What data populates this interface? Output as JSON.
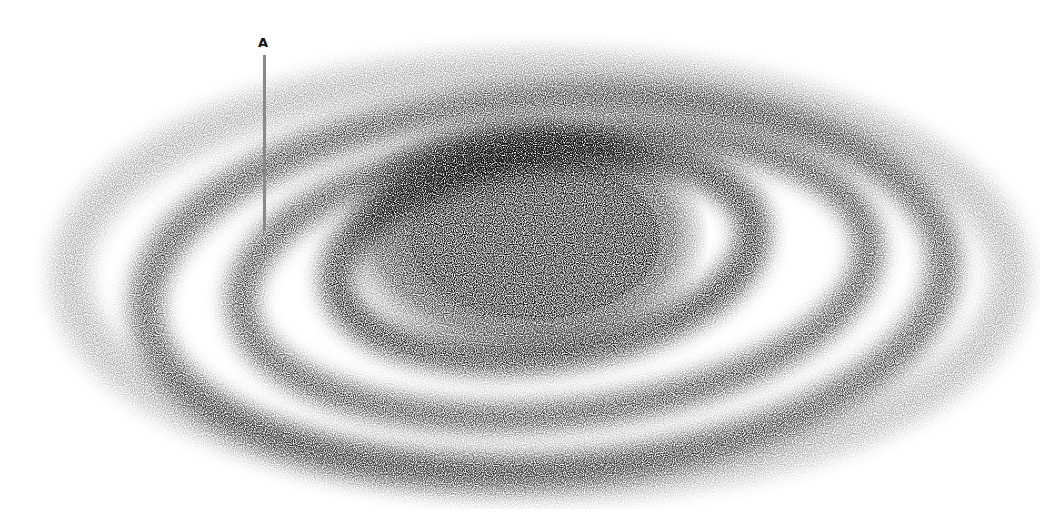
{
  "figure": {
    "type": "stippled spiral galaxy illustration",
    "annotations": [
      {
        "label": "A",
        "pointer_color": "#888888"
      }
    ],
    "colors": {
      "background": "#ffffff",
      "ink": "#000000"
    }
  }
}
